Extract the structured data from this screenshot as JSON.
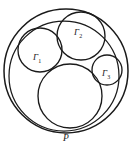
{
  "figure": {
    "background_color": "#ffffff",
    "stroke_color": "#1a1a1a",
    "width": 132,
    "height": 145,
    "labels": {
      "gamma1": {
        "base": "Γ",
        "subscript": "1",
        "full": "Γ1"
      },
      "gamma2": {
        "base": "Γ",
        "subscript": "2",
        "full": "Γ2"
      },
      "gamma3": {
        "base": "Γ",
        "subscript": "3",
        "full": "Γ3"
      },
      "point_p": "P"
    }
  },
  "chart_data": {
    "type": "diagram",
    "xlabel": "",
    "ylabel": "",
    "xlim": [
      0,
      132
    ],
    "ylim": [
      0,
      145
    ],
    "grid": false,
    "legend": "none",
    "annotations": [
      {
        "text": "Γ1",
        "x": 37,
        "y": 57
      },
      {
        "text": "Γ2",
        "x": 78,
        "y": 32
      },
      {
        "text": "Γ3",
        "x": 107,
        "y": 73
      },
      {
        "text": "P",
        "x": 66,
        "y": 138
      }
    ],
    "shapes": [
      {
        "name": "outer-circle",
        "kind": "circle",
        "cx": 66,
        "cy": 71,
        "r": 62,
        "stroke": "#1a1a1a",
        "stroke_width": 1.5,
        "fill": "none",
        "label": ""
      },
      {
        "name": "inner-circle",
        "kind": "circle",
        "cx": 64,
        "cy": 76,
        "r": 55,
        "stroke": "#1a1a1a",
        "stroke_width": 1.25,
        "fill": "none",
        "label": ""
      },
      {
        "name": "circle-gamma1",
        "kind": "circle",
        "cx": 40,
        "cy": 50,
        "r": 22,
        "stroke": "#1a1a1a",
        "stroke_width": 1.35,
        "fill": "none",
        "label": "Γ1"
      },
      {
        "name": "circle-gamma2",
        "kind": "circle",
        "cx": 81,
        "cy": 36,
        "r": 24,
        "stroke": "#1a1a1a",
        "stroke_width": 1.35,
        "fill": "none",
        "label": "Γ2"
      },
      {
        "name": "circle-gamma3",
        "kind": "circle",
        "cx": 107,
        "cy": 70,
        "r": 15,
        "stroke": "#1a1a1a",
        "stroke_width": 1.35,
        "fill": "none",
        "label": "Γ3"
      },
      {
        "name": "circle-bottom-large",
        "kind": "circle",
        "cx": 70,
        "cy": 96,
        "r": 32,
        "stroke": "#1a1a1a",
        "stroke_width": 1.35,
        "fill": "none",
        "label": ""
      }
    ],
    "tangency_points": [
      {
        "name": "P",
        "x": 66,
        "y": 130,
        "between": [
          "outer-circle",
          "inner-circle"
        ]
      }
    ]
  }
}
